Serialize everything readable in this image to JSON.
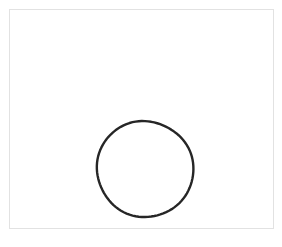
{
  "canvas": {
    "width": 282,
    "height": 247,
    "background_color": "#ffffff"
  },
  "frame": {
    "name": "drawing-frame",
    "x": 9,
    "y": 9,
    "width": 265,
    "height": 220,
    "border_color": "#e2e2e2",
    "border_width": 1.5,
    "fill_color": "#ffffff"
  },
  "shapes": [
    {
      "type": "circle",
      "label": "hand-drawn circle",
      "center_x": 145,
      "center_y": 169,
      "radius": 48,
      "stroke_color": "#262626",
      "stroke_width": 2.4,
      "fill": "none"
    }
  ],
  "caption": "",
  "colors": {
    "stroke": "#262626",
    "frame_border": "#e2e2e2",
    "background": "#ffffff"
  }
}
